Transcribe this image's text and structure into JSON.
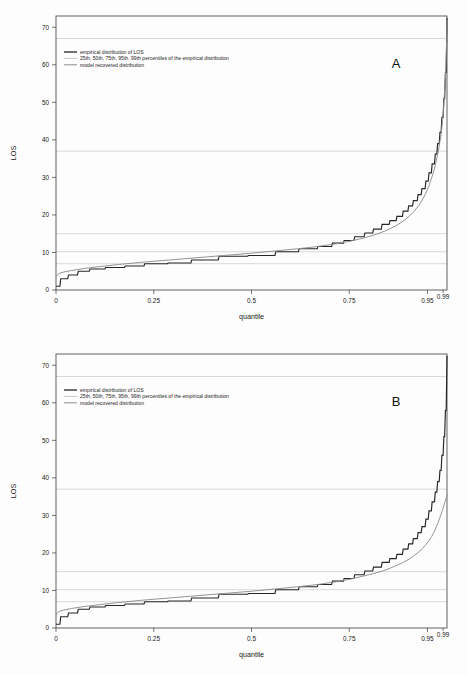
{
  "figure": {
    "background": "#fdfdfd",
    "colors": {
      "empirical": "#262626",
      "model": "#8e8e8e",
      "gridline": "#b9b9b9",
      "frame": "#3a3a3a"
    }
  },
  "legend": {
    "items": [
      {
        "label": "empirical distribution of LOS",
        "style": "dark-solid"
      },
      {
        "label": "25th, 50th, 75th, 95th, 99th percentiles of the empirical distribution",
        "style": "light-grid"
      },
      {
        "label": "model recovered distribution",
        "style": "gray-solid"
      }
    ]
  },
  "panels": [
    {
      "id": "A",
      "letter": "A"
    },
    {
      "id": "B",
      "letter": "B"
    }
  ],
  "chart_data": [
    {
      "type": "line",
      "title": "A",
      "xlabel": "quantile",
      "ylabel": "LOS",
      "xlim": [
        0,
        1
      ],
      "ylim": [
        0,
        73
      ],
      "grid": true,
      "legend_position": "top-left",
      "xticks": [
        0,
        0.25,
        0.5,
        0.75,
        0.95,
        0.99
      ],
      "xticklabels": [
        "0",
        "0.25",
        "0.5",
        "0.75",
        "0.95",
        "0.99"
      ],
      "yticks": [
        0,
        10,
        20,
        30,
        40,
        50,
        60,
        70
      ],
      "yticklabels": [
        "0",
        "10",
        "20",
        "30",
        "40",
        "50",
        "60",
        "70"
      ],
      "percentile_gridlines": [
        {
          "percentile": "25th",
          "los": 7.0
        },
        {
          "percentile": "50th",
          "los": 10.2
        },
        {
          "percentile": "75th",
          "los": 15.0
        },
        {
          "percentile": "95th",
          "los": 37.0
        },
        {
          "percentile": "99th",
          "los": 67.0
        }
      ],
      "series": [
        {
          "name": "empirical distribution of LOS",
          "step": true,
          "x": [
            0.0,
            0.01,
            0.012,
            0.03,
            0.032,
            0.055,
            0.057,
            0.085,
            0.087,
            0.125,
            0.127,
            0.175,
            0.177,
            0.225,
            0.227,
            0.285,
            0.287,
            0.345,
            0.347,
            0.415,
            0.417,
            0.49,
            0.492,
            0.56,
            0.562,
            0.62,
            0.622,
            0.668,
            0.67,
            0.705,
            0.707,
            0.735,
            0.737,
            0.762,
            0.764,
            0.788,
            0.79,
            0.81,
            0.812,
            0.832,
            0.834,
            0.852,
            0.854,
            0.87,
            0.872,
            0.886,
            0.888,
            0.9,
            0.902,
            0.912,
            0.914,
            0.924,
            0.926,
            0.934,
            0.936,
            0.944,
            0.946,
            0.952,
            0.954,
            0.96,
            0.962,
            0.968,
            0.97,
            0.974,
            0.976,
            0.98,
            0.982,
            0.985,
            0.987,
            0.99,
            0.992,
            0.994,
            0.996,
            0.998,
            1.0
          ],
          "y": [
            1.0,
            1.0,
            3.0,
            3.0,
            4.0,
            4.0,
            5.0,
            5.0,
            5.6,
            5.6,
            6.0,
            6.0,
            6.4,
            6.4,
            7.0,
            7.0,
            7.2,
            7.2,
            8.0,
            8.0,
            9.0,
            9.0,
            9.2,
            9.2,
            10.2,
            10.2,
            11.0,
            11.0,
            11.6,
            11.6,
            12.5,
            12.5,
            13.2,
            13.2,
            14.2,
            14.2,
            15.2,
            15.2,
            16.2,
            16.2,
            17.5,
            17.5,
            18.5,
            18.5,
            19.6,
            19.6,
            21.0,
            21.0,
            22.4,
            22.4,
            23.8,
            23.8,
            25.4,
            25.4,
            27.0,
            27.0,
            29.0,
            29.0,
            31.2,
            31.2,
            33.6,
            33.6,
            36.2,
            36.2,
            39.0,
            39.0,
            42.0,
            42.0,
            46.0,
            46.0,
            51.0,
            51.0,
            58.0,
            58.0,
            72.5
          ]
        },
        {
          "name": "model recovered distribution",
          "step": true,
          "x": [
            0.0,
            0.008,
            0.02,
            0.04,
            0.07,
            0.11,
            0.16,
            0.22,
            0.29,
            0.36,
            0.43,
            0.5,
            0.56,
            0.62,
            0.67,
            0.715,
            0.752,
            0.785,
            0.812,
            0.836,
            0.856,
            0.874,
            0.89,
            0.904,
            0.916,
            0.927,
            0.937,
            0.946,
            0.954,
            0.961,
            0.967,
            0.972,
            0.977,
            0.981,
            0.985,
            0.988,
            0.991,
            0.993,
            0.995,
            0.997,
            0.998,
            0.999,
            1.0
          ],
          "y": [
            3.6,
            4.4,
            4.8,
            5.2,
            5.7,
            6.2,
            6.8,
            7.4,
            8.0,
            8.6,
            9.2,
            9.8,
            10.4,
            11.0,
            11.6,
            12.3,
            13.0,
            13.8,
            14.6,
            15.5,
            16.4,
            17.4,
            18.5,
            19.7,
            21.0,
            22.4,
            24.0,
            25.8,
            27.8,
            30.0,
            32.0,
            34.2,
            36.5,
            39.0,
            41.5,
            44.5,
            48.0,
            51.5,
            55.0,
            59.0,
            62.5,
            66.5,
            72.0
          ]
        }
      ]
    },
    {
      "type": "line",
      "title": "B",
      "xlabel": "quantile",
      "ylabel": "LOS",
      "xlim": [
        0,
        1
      ],
      "ylim": [
        0,
        73
      ],
      "grid": true,
      "legend_position": "top-left",
      "xticks": [
        0,
        0.25,
        0.5,
        0.75,
        0.95,
        0.99
      ],
      "xticklabels": [
        "0",
        "0.25",
        "0.5",
        "0.75",
        "0.95",
        "0.99"
      ],
      "yticks": [
        0,
        10,
        20,
        30,
        40,
        50,
        60,
        70
      ],
      "yticklabels": [
        "0",
        "10",
        "20",
        "30",
        "40",
        "50",
        "60",
        "70"
      ],
      "percentile_gridlines": [
        {
          "percentile": "25th",
          "los": 7.0
        },
        {
          "percentile": "50th",
          "los": 10.2
        },
        {
          "percentile": "75th",
          "los": 15.0
        },
        {
          "percentile": "95th",
          "los": 37.0
        },
        {
          "percentile": "99th",
          "los": 67.0
        }
      ],
      "series": [
        {
          "name": "empirical distribution of LOS",
          "step": true,
          "x": [
            0.0,
            0.01,
            0.012,
            0.03,
            0.032,
            0.055,
            0.057,
            0.085,
            0.087,
            0.125,
            0.127,
            0.175,
            0.177,
            0.225,
            0.227,
            0.285,
            0.287,
            0.345,
            0.347,
            0.415,
            0.417,
            0.49,
            0.492,
            0.56,
            0.562,
            0.62,
            0.622,
            0.668,
            0.67,
            0.705,
            0.707,
            0.735,
            0.737,
            0.762,
            0.764,
            0.788,
            0.79,
            0.81,
            0.812,
            0.832,
            0.834,
            0.852,
            0.854,
            0.87,
            0.872,
            0.886,
            0.888,
            0.9,
            0.902,
            0.912,
            0.914,
            0.924,
            0.926,
            0.934,
            0.936,
            0.944,
            0.946,
            0.952,
            0.954,
            0.96,
            0.962,
            0.968,
            0.97,
            0.974,
            0.976,
            0.98,
            0.982,
            0.985,
            0.987,
            0.99,
            0.992,
            0.994,
            0.996,
            0.998,
            1.0
          ],
          "y": [
            1.0,
            1.0,
            3.0,
            3.0,
            4.0,
            4.0,
            5.0,
            5.0,
            5.6,
            5.6,
            6.0,
            6.0,
            6.4,
            6.4,
            7.0,
            7.0,
            7.2,
            7.2,
            8.0,
            8.0,
            9.0,
            9.0,
            9.2,
            9.2,
            10.2,
            10.2,
            11.0,
            11.0,
            11.6,
            11.6,
            12.5,
            12.5,
            13.2,
            13.2,
            14.2,
            14.2,
            15.2,
            15.2,
            16.2,
            16.2,
            17.5,
            17.5,
            18.5,
            18.5,
            19.6,
            19.6,
            21.0,
            21.0,
            22.4,
            22.4,
            23.8,
            23.8,
            25.4,
            25.4,
            27.0,
            27.0,
            29.0,
            29.0,
            31.2,
            31.2,
            33.6,
            33.6,
            36.2,
            36.2,
            39.0,
            39.0,
            42.0,
            42.0,
            46.0,
            46.0,
            51.0,
            51.0,
            58.0,
            58.0,
            72.5
          ]
        },
        {
          "name": "model recovered distribution",
          "step": true,
          "x": [
            0.0,
            0.008,
            0.02,
            0.04,
            0.07,
            0.11,
            0.16,
            0.22,
            0.29,
            0.36,
            0.43,
            0.5,
            0.56,
            0.62,
            0.67,
            0.715,
            0.752,
            0.785,
            0.812,
            0.836,
            0.856,
            0.874,
            0.89,
            0.904,
            0.916,
            0.927,
            0.937,
            0.946,
            0.954,
            0.961,
            0.967,
            0.972,
            0.977,
            0.981,
            0.985,
            0.988,
            0.991,
            0.993,
            0.995,
            0.997,
            0.998,
            0.999,
            1.0
          ],
          "y": [
            3.6,
            4.4,
            4.8,
            5.2,
            5.7,
            6.2,
            6.8,
            7.4,
            8.0,
            8.6,
            9.2,
            9.8,
            10.4,
            11.0,
            11.6,
            12.3,
            13.0,
            13.8,
            14.5,
            15.2,
            16.0,
            16.8,
            17.6,
            18.4,
            19.3,
            20.2,
            21.2,
            22.2,
            23.3,
            24.4,
            25.6,
            26.8,
            28.0,
            29.2,
            30.3,
            31.3,
            32.2,
            33.0,
            33.6,
            34.2,
            34.6,
            35.0,
            35.5
          ]
        }
      ]
    }
  ]
}
